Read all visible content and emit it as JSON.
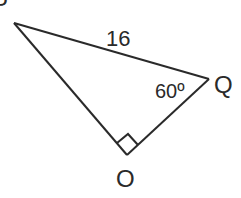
{
  "diagram": {
    "type": "right-triangle",
    "vertices": {
      "P": {
        "label": "P",
        "x": 14,
        "y": 23
      },
      "Q": {
        "label": "Q",
        "x": 209,
        "y": 79
      },
      "O": {
        "label": "O",
        "x": 127,
        "y": 155
      }
    },
    "side_PQ_label": "16",
    "angle_Q_label": "60º",
    "right_angle_at": "O",
    "line_color": "#2a2a2a"
  }
}
